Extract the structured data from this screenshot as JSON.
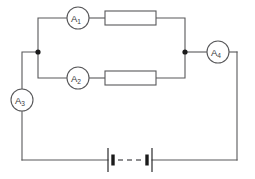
{
  "diagram": {
    "type": "electrical-schematic",
    "background_color": "#ffffff",
    "wire_color": "#58585a",
    "node_color": "#1b1b1b"
  },
  "meters": {
    "a1": {
      "letter": "A",
      "subscript": "1",
      "full_label": "A1",
      "kind": "ammeter",
      "branch": "upper-parallel-branch",
      "cx": 78,
      "cy": 18,
      "r": 11
    },
    "a2": {
      "letter": "A",
      "subscript": "2",
      "full_label": "A2",
      "kind": "ammeter",
      "branch": "lower-parallel-branch",
      "cx": 78,
      "cy": 78,
      "r": 11
    },
    "a3": {
      "letter": "A",
      "subscript": "3",
      "full_label": "A3",
      "kind": "ammeter",
      "branch": "left-main-wire",
      "cx": 22,
      "cy": 100,
      "r": 11
    },
    "a4": {
      "letter": "A",
      "subscript": "4",
      "full_label": "A4",
      "kind": "ammeter",
      "branch": "right-main-wire",
      "cx": 218,
      "cy": 52,
      "r": 11
    }
  },
  "resistors": {
    "r_upper": {
      "label": "",
      "branch": "upper-parallel-branch",
      "x": 105,
      "y": 11,
      "width": 51,
      "height": 14
    },
    "r_lower": {
      "label": "",
      "branch": "lower-parallel-branch",
      "x": 105,
      "y": 71,
      "width": 51,
      "height": 14
    }
  },
  "battery": {
    "label": "",
    "cell_count": 2,
    "gap_style": "dashed",
    "position": "bottom-wire",
    "left_cell": {
      "long_plate_x": 108,
      "short_plate_x": 113
    },
    "right_cell": {
      "short_plate_x": 147,
      "long_plate_x": 152
    },
    "dash_from_x": 118,
    "dash_to_x": 142,
    "y": 160
  },
  "nodes": {
    "left_junction": {
      "x": 38,
      "y": 52,
      "r": 2.6
    },
    "right_junction": {
      "x": 185,
      "y": 52,
      "r": 2.6
    }
  }
}
